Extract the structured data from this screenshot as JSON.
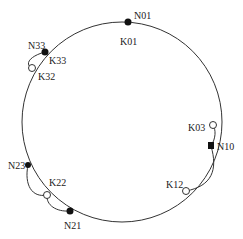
{
  "diagram": {
    "type": "chord-ring",
    "nodes": [
      {
        "id": "N01",
        "label": "N01",
        "kind": "node",
        "filled": true
      },
      {
        "id": "N33",
        "label": "N33",
        "kind": "node",
        "filled": true
      },
      {
        "id": "N10",
        "label": "N10",
        "kind": "node",
        "filled": true
      },
      {
        "id": "N23",
        "label": "N23",
        "kind": "node",
        "filled": true
      },
      {
        "id": "N21",
        "label": "N21",
        "kind": "node",
        "filled": true
      }
    ],
    "keys": [
      {
        "id": "K01",
        "label": "K01",
        "kind": "key",
        "filled": false,
        "on_node": "N01"
      },
      {
        "id": "K33",
        "label": "K33",
        "kind": "key",
        "filled": false,
        "on_node": "N33"
      },
      {
        "id": "K32",
        "label": "K32",
        "kind": "key",
        "filled": false
      },
      {
        "id": "K03",
        "label": "K03",
        "kind": "key",
        "filled": false
      },
      {
        "id": "K12",
        "label": "K12",
        "kind": "key",
        "filled": false
      },
      {
        "id": "K22",
        "label": "K22",
        "kind": "key",
        "filled": false
      }
    ],
    "links": [
      {
        "from": "N33",
        "to": "K32"
      },
      {
        "from": "N10",
        "to": "K03"
      },
      {
        "from": "N10",
        "to": "K12"
      },
      {
        "from": "N23",
        "to": "K22"
      },
      {
        "from": "N21",
        "to": "K22"
      }
    ]
  }
}
